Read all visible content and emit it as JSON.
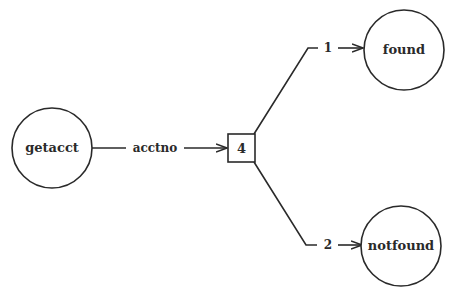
{
  "diagram": {
    "type": "structure-chart",
    "nodes": [
      {
        "id": "getacct",
        "shape": "circle",
        "label": "getacct"
      },
      {
        "id": "decision",
        "shape": "box",
        "label": "4"
      },
      {
        "id": "found",
        "shape": "circle",
        "label": "found"
      },
      {
        "id": "notfound",
        "shape": "circle",
        "label": "notfound"
      }
    ],
    "edges": [
      {
        "from": "getacct",
        "to": "decision",
        "label": "acctno"
      },
      {
        "from": "decision",
        "to": "found",
        "label": "1"
      },
      {
        "from": "decision",
        "to": "notfound",
        "label": "2"
      }
    ],
    "colors": {
      "ink": "#2a2a2a",
      "background": "#ffffff"
    }
  }
}
